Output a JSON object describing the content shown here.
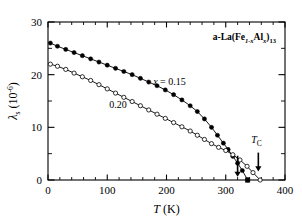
{
  "chart_data": {
    "type": "line",
    "title": "",
    "sample_label": "a-La(Fe1-xAlx)13",
    "sample_label_parts": {
      "prefix": "a-La(Fe",
      "sub1": "1-x",
      "mid": "Al",
      "sub2": "x",
      "suffix": ")",
      "sub3": "13"
    },
    "xlabel": "T (K)",
    "xlabel_parts": {
      "italic": "T",
      "rest": " (K)"
    },
    "ylabel": "λs (10-6)",
    "ylabel_parts": {
      "symbol": "λ",
      "sub": "s",
      "unit_open": " (10",
      "unit_exp": "-6",
      "unit_close": ")"
    },
    "xlim": [
      0,
      400
    ],
    "ylim": [
      0,
      30
    ],
    "x_major_ticks": [
      0,
      100,
      200,
      300,
      400
    ],
    "x_tick_labels": [
      "0",
      "100",
      "200",
      "300",
      "400"
    ],
    "x_minor_step": 20,
    "y_major_ticks": [
      0,
      10,
      20,
      30
    ],
    "y_tick_labels": [
      "0",
      "10",
      "20",
      "30"
    ],
    "y_minor_step": 5,
    "grid": false,
    "legend_position": "inline-annotations",
    "series": [
      {
        "name": "x = 0.15",
        "marker": "filled-circle",
        "label": "x = 0.15",
        "label_parts": {
          "italic": "x",
          "rest": " = 0.15"
        },
        "label_x": 205,
        "label_y": 18.0,
        "points": [
          {
            "x": 4,
            "y": 26.0
          },
          {
            "x": 16,
            "y": 25.4
          },
          {
            "x": 30,
            "y": 24.8
          },
          {
            "x": 44,
            "y": 24.2
          },
          {
            "x": 58,
            "y": 23.6
          },
          {
            "x": 72,
            "y": 23.0
          },
          {
            "x": 86,
            "y": 22.4
          },
          {
            "x": 100,
            "y": 21.8
          },
          {
            "x": 114,
            "y": 21.2
          },
          {
            "x": 128,
            "y": 20.6
          },
          {
            "x": 142,
            "y": 20.0
          },
          {
            "x": 156,
            "y": 19.3
          },
          {
            "x": 170,
            "y": 18.6
          },
          {
            "x": 184,
            "y": 17.9
          },
          {
            "x": 198,
            "y": 17.1
          },
          {
            "x": 212,
            "y": 16.2
          },
          {
            "x": 226,
            "y": 15.2
          },
          {
            "x": 240,
            "y": 14.1
          },
          {
            "x": 252,
            "y": 13.0
          },
          {
            "x": 264,
            "y": 11.6
          },
          {
            "x": 276,
            "y": 10.0
          },
          {
            "x": 286,
            "y": 8.5
          },
          {
            "x": 296,
            "y": 7.0
          },
          {
            "x": 304,
            "y": 5.8
          },
          {
            "x": 312,
            "y": 4.5
          },
          {
            "x": 320,
            "y": 3.2
          },
          {
            "x": 328,
            "y": 1.8
          },
          {
            "x": 337,
            "y": 0.0
          }
        ],
        "tc": 320,
        "end_marker": "filled-square",
        "end_point": {
          "x": 337,
          "y": 0.0
        }
      },
      {
        "name": "0.20",
        "marker": "open-circle",
        "label": "0.20",
        "label_x": 118,
        "label_y": 13.6,
        "points": [
          {
            "x": 4,
            "y": 22.0
          },
          {
            "x": 16,
            "y": 21.6
          },
          {
            "x": 30,
            "y": 21.0
          },
          {
            "x": 44,
            "y": 20.3
          },
          {
            "x": 58,
            "y": 19.6
          },
          {
            "x": 72,
            "y": 18.9
          },
          {
            "x": 86,
            "y": 18.1
          },
          {
            "x": 100,
            "y": 17.3
          },
          {
            "x": 114,
            "y": 16.5
          },
          {
            "x": 128,
            "y": 15.7
          },
          {
            "x": 142,
            "y": 14.9
          },
          {
            "x": 156,
            "y": 14.1
          },
          {
            "x": 170,
            "y": 13.3
          },
          {
            "x": 184,
            "y": 12.5
          },
          {
            "x": 198,
            "y": 11.7
          },
          {
            "x": 212,
            "y": 10.9
          },
          {
            "x": 226,
            "y": 10.1
          },
          {
            "x": 240,
            "y": 9.3
          },
          {
            "x": 252,
            "y": 8.5
          },
          {
            "x": 264,
            "y": 7.7
          },
          {
            "x": 276,
            "y": 6.9
          },
          {
            "x": 288,
            "y": 6.2
          },
          {
            "x": 300,
            "y": 5.6
          },
          {
            "x": 312,
            "y": 4.8
          },
          {
            "x": 324,
            "y": 3.8
          },
          {
            "x": 336,
            "y": 2.6
          },
          {
            "x": 346,
            "y": 1.4
          },
          {
            "x": 358,
            "y": 0.0
          }
        ],
        "tc": 355,
        "end_marker": "open-circle",
        "end_point": {
          "x": 358,
          "y": 0.0
        }
      }
    ],
    "annotations": [
      {
        "name": "tc-label",
        "text": "TC",
        "text_parts": {
          "italic": "T",
          "sub": "C"
        },
        "x": 352,
        "y": 7.0
      },
      {
        "name": "tc-arrow-0.15",
        "type": "down-arrow",
        "x": 320,
        "y_top": 4.6,
        "y_tip": 0.6
      },
      {
        "name": "tc-arrow-0.20",
        "type": "down-arrow",
        "x": 355,
        "y_top": 5.2,
        "y_tip": 1.6
      }
    ]
  }
}
